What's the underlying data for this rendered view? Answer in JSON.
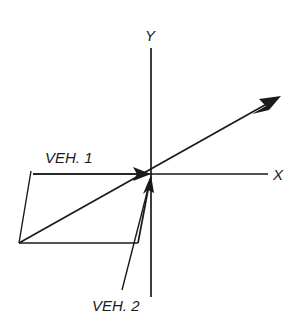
{
  "diagram": {
    "background_color": "#ffffff",
    "ink_color": "#1a1a1a",
    "axes": {
      "x_label": "X",
      "y_label": "Y",
      "origin": {
        "x": 151,
        "y": 174
      },
      "x_axis": {
        "x1": 33,
        "y1": 174,
        "x2": 268,
        "y2": 174
      },
      "y_axis": {
        "x1": 151,
        "y1": 48,
        "x2": 151,
        "y2": 297
      }
    },
    "vectors": [
      {
        "name": "veh-1",
        "label": "VEH. 1",
        "label_x": 45,
        "label_y": 163,
        "tail": {
          "x": 33,
          "y": 174
        },
        "head": {
          "x": 151,
          "y": 174
        },
        "arrowhead": "at-head",
        "description": "horizontal vector pointing right toward origin"
      },
      {
        "name": "veh-2",
        "label": "VEH. 2",
        "label_x": 92,
        "label_y": 311,
        "tail": {
          "x": 138,
          "y": 243
        },
        "head": {
          "x": 151,
          "y": 176
        },
        "arrowhead": "at-head",
        "description": "steep vector pointing up toward origin"
      },
      {
        "name": "resultant",
        "label": "",
        "tail": {
          "x": 19,
          "y": 243
        },
        "head": {
          "x": 281,
          "y": 96
        },
        "arrowhead": "at-head",
        "description": "resultant diagonal vector pointing up and to the right"
      }
    ],
    "construction_lines": [
      {
        "name": "parallelogram-left-side",
        "x1": 31,
        "y1": 172,
        "x2": 19,
        "y2": 243
      },
      {
        "name": "parallelogram-bottom-side",
        "x1": 19,
        "y1": 243,
        "x2": 138,
        "y2": 243
      }
    ],
    "leader_lines": [
      {
        "name": "veh-2-leader",
        "x1": 151,
        "y1": 176,
        "x2": 122,
        "y2": 290
      }
    ]
  }
}
